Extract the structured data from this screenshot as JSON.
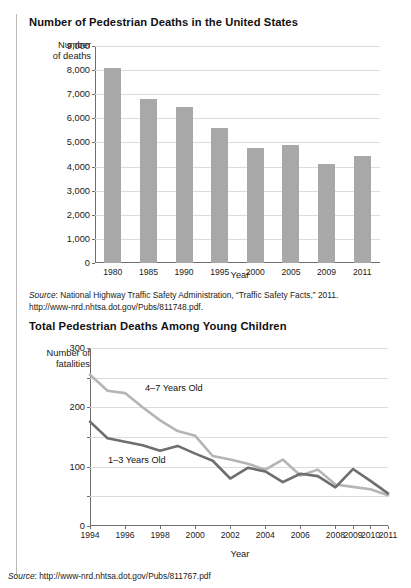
{
  "figure1": {
    "title": "Number of Pedestrian Deaths in the United States",
    "ylabel_line1": "Number",
    "ylabel_line2": "of deaths",
    "xlabel": "Year",
    "source_prefix": "Source",
    "source_text": ": National Highway Traffic Safety Administration, “Traffic Safety Facts,” 2011.",
    "source_url": "http://www-nrd.nhtsa.dot.gov/Pubs/811748.pdf."
  },
  "figure2": {
    "title": "Total Pedestrian Deaths Among Young Children",
    "ylabel_line1": "Number of",
    "ylabel_line2": "fatalities",
    "xlabel": "Year",
    "source_prefix": "Source",
    "source_text": ": http://www-nrd.nhtsa.dot.gov/Pubs/811767.pdf"
  },
  "colors": {
    "bar_fill": "#a8a8a8",
    "series_young": "#6e6e6e",
    "series_older": "#b5b5b5",
    "gridline": "#dcdcdc",
    "axis": "#6e6e6e"
  },
  "chart_data": [
    {
      "type": "bar",
      "title": "Number of Pedestrian Deaths in the United States",
      "xlabel": "Year",
      "ylabel": "Number of deaths",
      "categories": [
        "1980",
        "1985",
        "1990",
        "1995",
        "2000",
        "2005",
        "2009",
        "2011"
      ],
      "values": [
        8070,
        6800,
        6480,
        5590,
        4760,
        4890,
        4100,
        4430
      ],
      "ylim": [
        0,
        9000
      ],
      "ytick_labels": [
        "0",
        "1,000",
        "2,000",
        "3,000",
        "4,000",
        "5,000",
        "6,000",
        "7,000",
        "8,000",
        "9,000"
      ],
      "ytick_values": [
        0,
        1000,
        2000,
        3000,
        4000,
        5000,
        6000,
        7000,
        8000,
        9000
      ],
      "grid": true,
      "legend": "none"
    },
    {
      "type": "line",
      "title": "Total Pedestrian Deaths Among Young Children",
      "xlabel": "Year",
      "ylabel": "Number of fatalities",
      "x": [
        1994,
        1995,
        1996,
        1997,
        1998,
        1999,
        2000,
        2001,
        2002,
        2003,
        2004,
        2005,
        2006,
        2007,
        2008,
        2009,
        2010,
        2011
      ],
      "xtick_labels": [
        "1994",
        "1996",
        "1998",
        "2000",
        "2002",
        "2004",
        "2006",
        "2008",
        "2009",
        "2010",
        "2011"
      ],
      "xtick_values": [
        1994,
        1996,
        1998,
        2000,
        2002,
        2004,
        2006,
        2008,
        2009,
        2010,
        2011
      ],
      "ylim": [
        0,
        300
      ],
      "ytick_labels": [
        "0",
        "100",
        "200",
        "300"
      ],
      "ytick_values": [
        0,
        100,
        200,
        300
      ],
      "minor_ytick_values": [
        50,
        150,
        250
      ],
      "grid": true,
      "legend": "inline-labels",
      "series": [
        {
          "name": "4–7 Years Old",
          "color": "#b5b5b5",
          "values": [
            255,
            228,
            224,
            200,
            178,
            160,
            152,
            118,
            112,
            105,
            95,
            112,
            85,
            95,
            70,
            66,
            62,
            52
          ]
        },
        {
          "name": "1–3 Years Old",
          "color": "#6e6e6e",
          "values": [
            176,
            148,
            142,
            136,
            127,
            135,
            122,
            110,
            80,
            98,
            92,
            74,
            88,
            84,
            65,
            96,
            76,
            55
          ]
        }
      ]
    }
  ]
}
